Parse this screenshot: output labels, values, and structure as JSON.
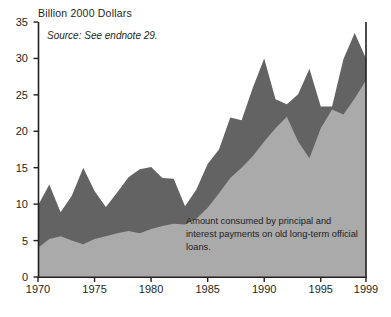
{
  "chart": {
    "axis_title": "Billion 2000 Dollars",
    "source_note": "Source: See endnote 29.",
    "annotation": "Amount consumed by principal and interest payments on old long-term official loans."
  },
  "chart_data": {
    "type": "area",
    "stacked": true,
    "title": "Billion 2000 Dollars",
    "subtitle": "Source: See endnote 29.",
    "xlabel": "",
    "ylabel": "Billion 2000 Dollars",
    "xlim": [
      1970,
      1999
    ],
    "ylim": [
      0,
      35
    ],
    "yticks": [
      0,
      5,
      10,
      15,
      20,
      25,
      30,
      35
    ],
    "xticks": [
      1970,
      1975,
      1980,
      1985,
      1990,
      1995,
      1999
    ],
    "grid": false,
    "legend": "none",
    "annotations": [
      {
        "text": "Amount consumed by principal and interest payments on old long-term official loans.",
        "x": 1986,
        "y": 6,
        "series": "debt-service"
      }
    ],
    "colors": {
      "debt_service": "#aaaaaa",
      "net_transfer": "#636363",
      "axis": "#231f20",
      "background": "#ffffff"
    },
    "x": [
      1970,
      1971,
      1972,
      1973,
      1974,
      1975,
      1976,
      1977,
      1978,
      1979,
      1980,
      1981,
      1982,
      1983,
      1984,
      1985,
      1986,
      1987,
      1988,
      1989,
      1990,
      1991,
      1992,
      1993,
      1994,
      1995,
      1996,
      1997,
      1998,
      1999
    ],
    "series": [
      {
        "name": "Amount consumed by principal and interest payments on old long-term official loans.",
        "key": "debt_service",
        "color": "#aaaaaa",
        "values": [
          4.0,
          5.2,
          5.6,
          5.0,
          4.5,
          5.2,
          5.6,
          6.0,
          6.3,
          6.0,
          6.6,
          7.0,
          7.3,
          7.2,
          8.0,
          9.5,
          11.5,
          13.6,
          15.0,
          16.6,
          18.6,
          20.4,
          22.0,
          18.6,
          16.3,
          20.4,
          23.0,
          22.3,
          24.5,
          27.0
        ]
      },
      {
        "name": "Remaining aid above debt service",
        "key": "net_transfer",
        "color": "#636363",
        "values": [
          5.8,
          7.5,
          3.3,
          6.2,
          10.5,
          6.6,
          4.0,
          5.6,
          7.4,
          8.8,
          8.5,
          6.6,
          6.2,
          2.5,
          4.0,
          6.0,
          6.0,
          8.3,
          6.5,
          9.4,
          11.4,
          4.0,
          1.7,
          6.5,
          12.3,
          3.0,
          0.4,
          7.6,
          9.0,
          3.0
        ]
      }
    ],
    "totals": [
      9.8,
      12.7,
      8.9,
      11.2,
      15.0,
      11.8,
      9.6,
      11.6,
      13.7,
      14.8,
      15.1,
      13.6,
      13.5,
      9.7,
      12.0,
      15.5,
      17.5,
      21.9,
      21.5,
      26.0,
      30.0,
      24.4,
      23.7,
      25.1,
      28.6,
      23.4,
      23.4,
      29.9,
      33.5,
      30.0
    ]
  }
}
